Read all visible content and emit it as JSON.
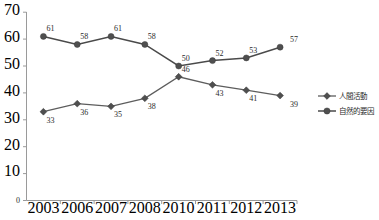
{
  "chart_data": {
    "type": "line",
    "title": "",
    "xlabel": "",
    "ylabel": "",
    "grid": false,
    "ylim": [
      0,
      70
    ],
    "ytick_step": 10,
    "yticks": [
      "0",
      "10",
      "20",
      "30",
      "40",
      "50",
      "60",
      "70"
    ],
    "categories": [
      "2003",
      "2006",
      "2007",
      "2008",
      "2010",
      "2011",
      "2012",
      "2013"
    ],
    "legend_position": "right",
    "series": [
      {
        "name": "人間活動",
        "marker": "diamond-marker",
        "color": "#5d5d5d",
        "values": [
          33,
          36,
          35,
          38,
          46,
          43,
          41,
          39
        ],
        "labels": [
          "33",
          "36",
          "35",
          "38",
          "46",
          "43",
          "41",
          "39"
        ]
      },
      {
        "name": "自然的要因",
        "marker": "circle-marker",
        "color": "#4a4a4a",
        "values": [
          61,
          58,
          61,
          58,
          50,
          52,
          53,
          57
        ],
        "labels": [
          "61",
          "58",
          "61",
          "58",
          "50",
          "52",
          "53",
          "57"
        ]
      }
    ]
  },
  "legend": {
    "entries": [
      {
        "label": "人間活動"
      },
      {
        "label": "自然的要因"
      }
    ]
  },
  "axes": {
    "y_axis_name": "value-axis",
    "x_axis_name": "category-axis"
  }
}
